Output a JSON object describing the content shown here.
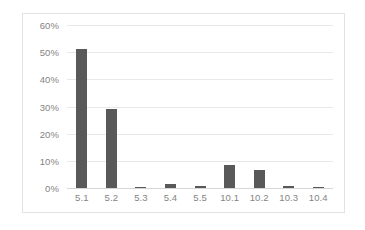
{
  "chart_data": {
    "type": "bar",
    "title": "",
    "subtitle": "",
    "xlabel": "",
    "ylabel": "",
    "categories": [
      "5.1",
      "5.2",
      "5.3",
      "5.4",
      "5.5",
      "10.1",
      "10.2",
      "10.3",
      "10.4"
    ],
    "values": [
      51.0,
      29.0,
      0.3,
      1.3,
      0.6,
      8.5,
      6.5,
      0.6,
      0.3
    ],
    "value_format": "percent",
    "ylim": [
      0,
      60
    ],
    "ytick_values": [
      0,
      10,
      20,
      30,
      40,
      50,
      60
    ],
    "ytick_labels": [
      "0%",
      "10%",
      "20%",
      "30%",
      "40%",
      "50%",
      "60%"
    ],
    "grid": true,
    "grid_axis": "y",
    "legend": false,
    "legend_position": "none",
    "series": [
      {
        "name": "",
        "values": [
          51.0,
          29.0,
          0.3,
          1.3,
          0.6,
          8.5,
          6.5,
          0.6,
          0.3
        ],
        "color": "#595959"
      }
    ],
    "annotations": []
  },
  "style": {
    "bar_color": "#595959",
    "gridline_color": "#e8e8e8",
    "baseline_color": "#d6d6d6",
    "tick_label_color": "#848484",
    "frame_border_color": "#e2e2e2",
    "plot_background": "#ffffff"
  }
}
